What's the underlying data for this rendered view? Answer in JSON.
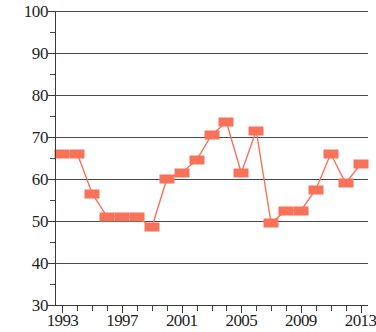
{
  "chart_data": {
    "type": "line",
    "title": "",
    "subtitle": "",
    "xlabel": "",
    "ylabel": "",
    "xlim": [
      1992.5,
      2013.5
    ],
    "ylim": [
      30,
      100
    ],
    "grid": true,
    "legend": false,
    "legend_position": "none",
    "marker": "square",
    "series_color": "#f8725a",
    "x": [
      1993,
      1994,
      1995,
      1996,
      1997,
      1998,
      1999,
      2000,
      2001,
      2002,
      2003,
      2004,
      2005,
      2006,
      2007,
      2008,
      2009,
      2010,
      2011,
      2012,
      2013
    ],
    "values": [
      66,
      66,
      56.5,
      51,
      51,
      51,
      48.5,
      60,
      61.5,
      64.5,
      70.5,
      73.5,
      61.5,
      71.5,
      49.5,
      52.5,
      52.5,
      57.5,
      66,
      59,
      63.5
    ],
    "series": [
      {
        "name": "series-1",
        "color": "#f8725a",
        "values": [
          66,
          66,
          56.5,
          51,
          51,
          51,
          48.5,
          60,
          61.5,
          64.5,
          70.5,
          73.5,
          61.5,
          71.5,
          49.5,
          52.5,
          52.5,
          57.5,
          66,
          59,
          63.5
        ]
      }
    ],
    "y_ticks_major": [
      30,
      40,
      50,
      60,
      70,
      80,
      90,
      100
    ],
    "y_tick_labels": [
      "30",
      "40",
      "50",
      "60",
      "70",
      "80",
      "90",
      "100"
    ],
    "y_ticks_minor": [
      35,
      45,
      55,
      65,
      75,
      85,
      95
    ],
    "x_ticks_all": [
      1993,
      1994,
      1995,
      1996,
      1997,
      1998,
      1999,
      2000,
      2001,
      2002,
      2003,
      2004,
      2005,
      2006,
      2007,
      2008,
      2009,
      2010,
      2011,
      2012,
      2013
    ],
    "x_tick_labels": [
      {
        "value": 1993,
        "label": "1993"
      },
      {
        "value": 1997,
        "label": "1997"
      },
      {
        "value": 2001,
        "label": "2001"
      },
      {
        "value": 2005,
        "label": "2005"
      },
      {
        "value": 2009,
        "label": "2009"
      },
      {
        "value": 2013,
        "label": "2013"
      }
    ]
  }
}
